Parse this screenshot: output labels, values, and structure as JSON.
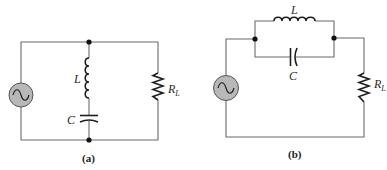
{
  "figure": {
    "panels": [
      {
        "id": "a",
        "caption": "(a)",
        "components": {
          "source": "ac-source",
          "inductor_label": "L",
          "capacitor_label": "C",
          "resistor_label": "R",
          "resistor_subscript": "L"
        },
        "topology": "series LC branch in parallel with source and load resistor"
      },
      {
        "id": "b",
        "caption": "(b)",
        "components": {
          "source": "ac-source",
          "inductor_label": "L",
          "capacitor_label": "C",
          "resistor_label": "R",
          "resistor_subscript": "L"
        },
        "topology": "parallel LC tank in series between source and load resistor"
      }
    ],
    "colors": {
      "wire": "#6b6b6b",
      "component": "#1e1e1e",
      "source_fill": "#b8b8b8"
    }
  }
}
